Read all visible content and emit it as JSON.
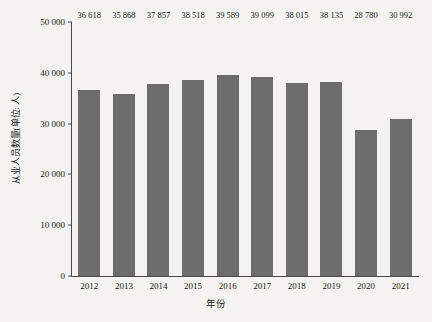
{
  "chart_data": {
    "type": "bar",
    "title": "",
    "xlabel": "年份",
    "ylabel": "从业人员数量(单位: 人)",
    "categories": [
      "2012",
      "2013",
      "2014",
      "2015",
      "2016",
      "2017",
      "2018",
      "2019",
      "2020",
      "2021"
    ],
    "values": [
      36618,
      35868,
      37857,
      38518,
      39589,
      39099,
      38015,
      38135,
      28780,
      30992
    ],
    "value_labels": [
      "36 618",
      "35 868",
      "37 857",
      "38 518",
      "39 589",
      "39 099",
      "38 015",
      "38 135",
      "28 780",
      "30 992"
    ],
    "ylim": [
      0,
      50000
    ],
    "yticks": [
      0,
      10000,
      20000,
      30000,
      40000,
      50000
    ],
    "ytick_labels": [
      "0",
      "10 000",
      "20 000",
      "30 000",
      "40 000",
      "50 000"
    ],
    "grid": false,
    "legend": null,
    "bar_color": "#6d6d6d",
    "axis_color": "#4a4a4a",
    "background_color": "#f4f3f1",
    "text_color": "#1a1a1a"
  }
}
